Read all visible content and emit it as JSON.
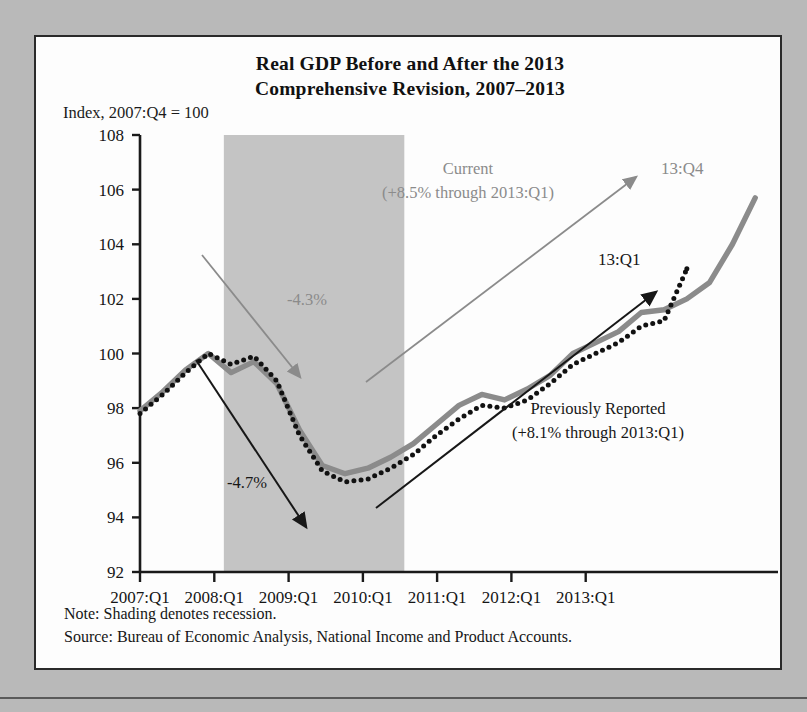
{
  "figure": {
    "title_line1": "Real GDP Before and After the 2013",
    "title_line2": "Comprehensive Revision, 2007–2013",
    "axis_unit_label": "Index, 2007:Q4 = 100",
    "note": "Note: Shading denotes recession.",
    "source": "Source: Bureau of Economic Analysis, National Income and Product Accounts.",
    "colors": {
      "current_series": "#8b8b8b",
      "previous_series": "#111111",
      "recession_shading": "#c4c4c4",
      "panel_background": "#fdfdfd",
      "page_background": "#b9b9b9",
      "axis": "#1a1a1a"
    }
  },
  "chart_data": {
    "type": "line",
    "title": "Real GDP Before and After the 2013 Comprehensive Revision, 2007–2013",
    "xlabel": "",
    "ylabel": "Index, 2007:Q4 = 100",
    "ylim": [
      92,
      108
    ],
    "yticks": [
      92,
      94,
      96,
      98,
      100,
      102,
      104,
      106,
      108
    ],
    "ytick_labels": [
      "92",
      "94",
      "96",
      "98",
      "100",
      "102",
      "104",
      "106",
      "108"
    ],
    "xlim": [
      2007.0,
      2014.0
    ],
    "xticks": [
      2007.0,
      2008.0,
      2009.0,
      2010.0,
      2011.0,
      2012.0,
      2013.0
    ],
    "xtick_labels": [
      "2007:Q1",
      "2008:Q1",
      "2009:Q1",
      "2010:Q1",
      "2011:Q1",
      "2012:Q1",
      "2013:Q1"
    ],
    "grid": false,
    "legend_position": "inline-annotations",
    "x": [
      2007.0,
      2007.25,
      2007.5,
      2007.75,
      2008.0,
      2008.25,
      2008.5,
      2008.75,
      2009.0,
      2009.25,
      2009.5,
      2009.75,
      2010.0,
      2010.25,
      2010.5,
      2010.75,
      2011.0,
      2011.25,
      2011.5,
      2011.75,
      2012.0,
      2012.25,
      2012.5,
      2012.75,
      2013.0,
      2013.25,
      2013.5,
      2013.75
    ],
    "x_quarter_labels": [
      "2007:Q1",
      "2007:Q2",
      "2007:Q3",
      "2007:Q4",
      "2008:Q1",
      "2008:Q2",
      "2008:Q3",
      "2008:Q4",
      "2009:Q1",
      "2009:Q2",
      "2009:Q3",
      "2009:Q4",
      "2010:Q1",
      "2010:Q2",
      "2010:Q3",
      "2010:Q4",
      "2011:Q1",
      "2011:Q2",
      "2011:Q3",
      "2011:Q4",
      "2012:Q1",
      "2012:Q2",
      "2012:Q3",
      "2012:Q4",
      "2013:Q1",
      "2013:Q2",
      "2013:Q3",
      "2013:Q4"
    ],
    "series": [
      {
        "name": "Current",
        "style": "solid-thick-gray",
        "color": "#8b8b8b",
        "values": [
          97.9,
          98.6,
          99.4,
          100.0,
          99.3,
          99.7,
          98.9,
          97.2,
          95.9,
          95.6,
          95.8,
          96.2,
          96.7,
          97.4,
          98.1,
          98.5,
          98.3,
          98.7,
          99.2,
          100.0,
          100.4,
          100.8,
          101.5,
          101.6,
          102.0,
          102.6,
          104.0,
          105.7
        ]
      },
      {
        "name": "Previously Reported",
        "style": "dotted-black",
        "color": "#111111",
        "values": [
          97.8,
          98.5,
          99.3,
          100.0,
          99.6,
          99.9,
          99.0,
          97.0,
          95.7,
          95.3,
          95.4,
          95.8,
          96.3,
          97.0,
          97.6,
          98.1,
          98.0,
          98.3,
          98.9,
          99.6,
          100.0,
          100.4,
          101.0,
          101.2,
          103.1,
          null,
          null,
          null
        ]
      }
    ],
    "shaded_regions": [
      {
        "label": "recession",
        "x_start": 2007.92,
        "x_end": 2009.9,
        "color": "#c4c4c4"
      }
    ],
    "annotations": [
      {
        "id": "current-label",
        "text_line1": "Current",
        "text_line2": "(+8.5% through 2013:Q1)",
        "color": "#8b8b8b"
      },
      {
        "id": "previously-reported-label",
        "text_line1": "Previously Reported",
        "text_line2": "(+8.1% through 2013:Q1)",
        "color": "#171717"
      },
      {
        "id": "current-drop",
        "text": "-4.3%",
        "color": "#8b8b8b"
      },
      {
        "id": "previous-drop",
        "text": "-4.7%",
        "color": "#171717"
      },
      {
        "id": "current-endpoint",
        "text": "13:Q4",
        "color": "#8b8b8b"
      },
      {
        "id": "previous-endpoint",
        "text": "13:Q1",
        "color": "#171717"
      }
    ]
  }
}
